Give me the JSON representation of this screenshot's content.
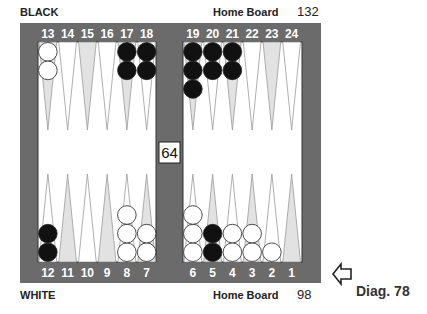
{
  "labels": {
    "top_player": "BLACK",
    "bottom_player": "WHITE",
    "top_home": "Home Board",
    "bottom_home": "Home Board",
    "top_pip": "132",
    "bottom_pip": "98",
    "diagram": "Diag. 78"
  },
  "cube": {
    "value": "64"
  },
  "arrow": {
    "icon": "left-arrow-icon",
    "direction": "left"
  },
  "colors": {
    "frame": "#6b6b6b",
    "board": "#ffffff",
    "shaded_point": "#e2e2e2",
    "point_line": "#9a9a9a",
    "black_checker": "#111111",
    "white_checker": "#ffffff"
  },
  "points": [
    {
      "num": 1,
      "black": 0,
      "white": 0
    },
    {
      "num": 2,
      "black": 0,
      "white": 1
    },
    {
      "num": 3,
      "black": 0,
      "white": 2
    },
    {
      "num": 4,
      "black": 0,
      "white": 2
    },
    {
      "num": 5,
      "black": 2,
      "white": 0
    },
    {
      "num": 6,
      "black": 0,
      "white": 3
    },
    {
      "num": 7,
      "black": 0,
      "white": 2
    },
    {
      "num": 8,
      "black": 0,
      "white": 3
    },
    {
      "num": 9,
      "black": 0,
      "white": 0
    },
    {
      "num": 10,
      "black": 0,
      "white": 0
    },
    {
      "num": 11,
      "black": 0,
      "white": 0
    },
    {
      "num": 12,
      "black": 2,
      "white": 0
    },
    {
      "num": 13,
      "black": 0,
      "white": 2
    },
    {
      "num": 14,
      "black": 0,
      "white": 0
    },
    {
      "num": 15,
      "black": 0,
      "white": 0
    },
    {
      "num": 16,
      "black": 0,
      "white": 0
    },
    {
      "num": 17,
      "black": 2,
      "white": 0
    },
    {
      "num": 18,
      "black": 2,
      "white": 0
    },
    {
      "num": 19,
      "black": 3,
      "white": 0
    },
    {
      "num": 20,
      "black": 2,
      "white": 0
    },
    {
      "num": 21,
      "black": 2,
      "white": 0
    },
    {
      "num": 22,
      "black": 0,
      "white": 0
    },
    {
      "num": 23,
      "black": 0,
      "white": 0
    },
    {
      "num": 24,
      "black": 0,
      "white": 0
    }
  ]
}
